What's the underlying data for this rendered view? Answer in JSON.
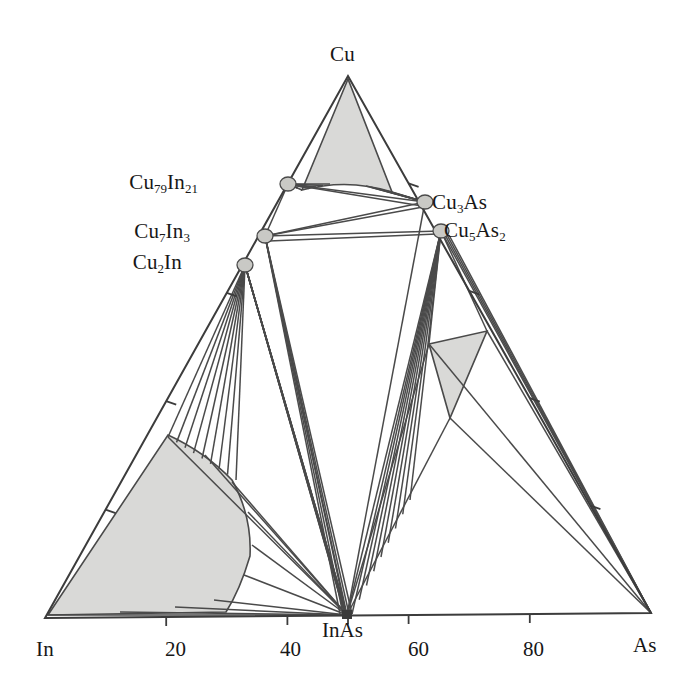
{
  "figure": {
    "kind": "ternary-phase-diagram",
    "system": "Cu-In-As",
    "background_color": "#ffffff",
    "line_color": "#4a4a4a",
    "shade_color": "#d9d9d7",
    "node_color": "#c9c9c5"
  },
  "corners": {
    "left": {
      "label": "In",
      "x": 45,
      "y": 618
    },
    "right": {
      "label": "As",
      "x": 651,
      "y": 613
    },
    "top": {
      "label": "Cu",
      "x": 348,
      "y": 76
    }
  },
  "axis_ticks": {
    "bottom": [
      {
        "label": "20",
        "value": 20
      },
      {
        "label": "40",
        "value": 40
      },
      {
        "label": "60",
        "value": 60
      },
      {
        "label": "80",
        "value": 80
      }
    ],
    "bottom_special": {
      "label": "InAs",
      "value": 50
    },
    "left_unlabeled_count": 4,
    "right_unlabeled_count": 4
  },
  "compounds": [
    {
      "name": "Cu79In21",
      "label_html": "Cu<sub>79</sub>In<sub>21</sub>",
      "x": 288,
      "y": 184,
      "label_x": 198,
      "label_y": 170,
      "anchor": "end"
    },
    {
      "name": "Cu7In3",
      "label_html": "Cu<sub>7</sub>In<sub>3</sub>",
      "x": 265,
      "y": 236,
      "label_x": 190,
      "label_y": 219,
      "anchor": "end"
    },
    {
      "name": "Cu2In",
      "label_html": "Cu<sub>2</sub>In",
      "x": 245,
      "y": 265,
      "label_x": 182,
      "label_y": 250,
      "anchor": "end"
    },
    {
      "name": "Cu3As",
      "label_html": "Cu<sub>3</sub>As",
      "x": 425,
      "y": 202,
      "label_x": 432,
      "label_y": 190,
      "anchor": "start"
    },
    {
      "name": "Cu5As2",
      "label_html": "Cu<sub>5</sub>As<sub>2</sub>",
      "x": 441,
      "y": 231,
      "label_x": 444,
      "label_y": 218,
      "anchor": "start"
    },
    {
      "name": "InAs",
      "label_html": "InAs",
      "x": 347,
      "y": 615,
      "label_x": 322,
      "label_y": 618,
      "anchor": "start"
    }
  ],
  "shaded_regions": [
    {
      "name": "cu-solid-solution",
      "description": "Cu-rich solid solution at Cu apex"
    },
    {
      "name": "in-rich-liquid",
      "description": "In-rich liquid field along In edge"
    },
    {
      "name": "as-rich-three-phase",
      "description": "three-phase triangle on As side"
    }
  ],
  "corner_labels": {
    "In": "In",
    "As": "As",
    "Cu": "Cu"
  },
  "chart_data": {
    "type": "scatter",
    "title": "",
    "xlabel": "",
    "ylabel": "",
    "ternary_axes": [
      "In",
      "Cu",
      "As"
    ],
    "tick_labels": [
      "20",
      "40",
      "InAs",
      "60",
      "80"
    ],
    "points": [
      {
        "name": "Cu",
        "at": "top apex"
      },
      {
        "name": "In",
        "at": "left apex"
      },
      {
        "name": "As",
        "at": "right apex"
      },
      {
        "name": "Cu79In21",
        "on": "Cu-In edge"
      },
      {
        "name": "Cu7In3",
        "on": "Cu-In edge"
      },
      {
        "name": "Cu2In",
        "on": "Cu-In edge"
      },
      {
        "name": "Cu3As",
        "on": "Cu-As edge"
      },
      {
        "name": "Cu5As2",
        "on": "Cu-As edge"
      },
      {
        "name": "InAs",
        "on": "In-As edge at 50"
      }
    ]
  }
}
